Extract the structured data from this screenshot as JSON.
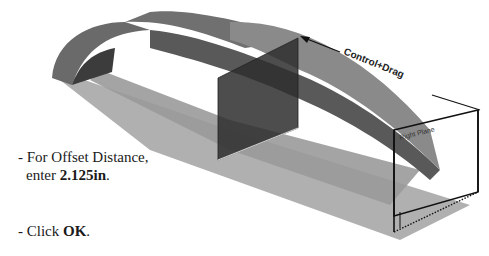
{
  "instructions": [
    {
      "prefix": "- For Offset Distance,",
      "line2_prefix": "enter ",
      "value": "2.125in",
      "suffix": "."
    },
    {
      "prefix": "- Click ",
      "value": "OK",
      "suffix": "."
    }
  ],
  "viewport": {
    "callout_label": "Control+Drag",
    "plane_label": "Right Plane"
  },
  "colors": {
    "part_face": "#6e6e6e",
    "part_dark": "#3a3a3a",
    "plane_fill": "#8c8c8c",
    "plane_edge": "#111111"
  }
}
